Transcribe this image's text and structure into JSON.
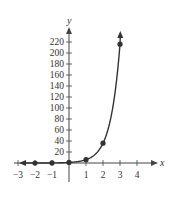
{
  "chart_data": {
    "type": "line",
    "title": "",
    "xlabel": "x",
    "ylabel": "y",
    "function": "y = 6^x",
    "x": [
      -2,
      -1,
      0,
      1,
      2,
      3
    ],
    "values": [
      0.028,
      0.167,
      1,
      6,
      36,
      216
    ],
    "points": [
      [
        -2,
        0.028
      ],
      [
        -1,
        0.167
      ],
      [
        0,
        1
      ],
      [
        1,
        6
      ],
      [
        2,
        36
      ],
      [
        3,
        216
      ]
    ],
    "x_ticks": [
      -3,
      -2,
      -1,
      1,
      2,
      3,
      4
    ],
    "x_tick_labels": [
      "−3",
      "−2",
      "−1",
      "1",
      "2",
      "3",
      "4"
    ],
    "y_ticks": [
      20,
      40,
      60,
      80,
      100,
      120,
      140,
      160,
      180,
      200,
      220
    ],
    "y_tick_labels": [
      "20",
      "40",
      "60",
      "80",
      "100",
      "120",
      "140",
      "160",
      "180",
      "200",
      "220"
    ],
    "xlim": [
      -3,
      4
    ],
    "ylim": [
      0,
      230
    ],
    "grid": false,
    "legend": null,
    "colors": {
      "curve": "#333333",
      "axes": "#444444"
    }
  }
}
